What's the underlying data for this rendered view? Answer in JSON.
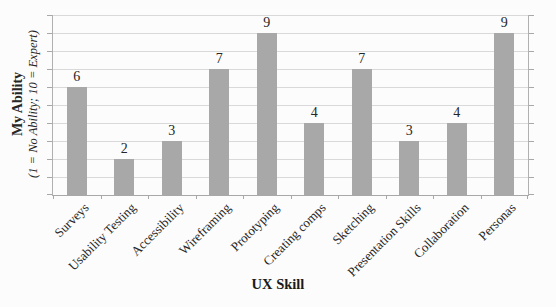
{
  "figure": {
    "y_axis_title": "My Ability",
    "y_axis_subtitle": "(1 = No Ability; 10 = Expert)",
    "x_axis_title": "UX Skill"
  },
  "colors": {
    "bar": "#a8a8a8",
    "gridline": "#d9d9d9",
    "axis": "#a8a8a8",
    "text": "#262626",
    "background": "#fcfcfc"
  },
  "chart_data": {
    "type": "bar",
    "title": "",
    "categories": [
      "Surveys",
      "Usability Testing",
      "Accessibility",
      "Wireframing",
      "Prototyping",
      "Creating comps",
      "Sketching",
      "Presentation Skills",
      "Collaboration",
      "Personas"
    ],
    "values": [
      6,
      2,
      3,
      7,
      9,
      4,
      7,
      3,
      4,
      9
    ],
    "xlabel": "UX Skill",
    "ylabel": "My Ability (1 = No Ability; 10 = Expert)",
    "ylim": [
      0,
      10
    ],
    "grid": "horizontal gridlines every 1 unit",
    "legend": "none",
    "data_labels": "value shown above each bar",
    "category_label_rotation_deg": 45
  }
}
